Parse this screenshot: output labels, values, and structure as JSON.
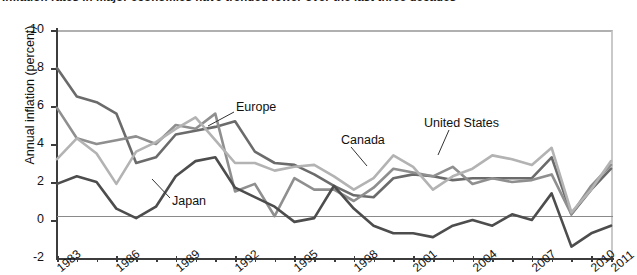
{
  "title": "Inflation rates in major economies have trended lower over the last three decades",
  "axes": {
    "ylabel": "Annual inflation (percent)",
    "yticks": [
      "10",
      "8",
      "6",
      "4",
      "2",
      "0",
      "-2"
    ],
    "xticks": [
      "1983",
      "1986",
      "1989",
      "1992",
      "1995",
      "1998",
      "2001",
      "2004",
      "2007",
      "2010",
      "2011"
    ]
  },
  "series_labels": {
    "europe": "Europe",
    "japan": "Japan",
    "canada": "Canada",
    "united_states": "United States"
  },
  "colors": {
    "europe": "#6b6b6b",
    "japan": "#4d4d4d",
    "canada": "#8f8f8f",
    "united_states": "#b3b3b3",
    "axis": "#3c3c3c",
    "text": "#111111"
  },
  "chart_data": {
    "type": "line",
    "title": "Inflation rates in major economies have trended lower over the last three decades",
    "xlabel": "",
    "ylabel": "Annual inflation (percent)",
    "ylim": [
      -2,
      10
    ],
    "xlim": [
      1983,
      2011
    ],
    "grid": false,
    "legend": "inline-labels",
    "x": [
      1983,
      1984,
      1985,
      1986,
      1987,
      1988,
      1989,
      1990,
      1991,
      1992,
      1993,
      1994,
      1995,
      1996,
      1997,
      1998,
      1999,
      2000,
      2001,
      2002,
      2003,
      2004,
      2005,
      2006,
      2007,
      2008,
      2009,
      2010,
      2011
    ],
    "series": [
      {
        "name": "Europe",
        "color": "#6b6b6b",
        "values": [
          8.0,
          6.5,
          6.2,
          5.6,
          3.0,
          3.3,
          4.5,
          4.7,
          4.9,
          5.2,
          3.6,
          3.0,
          2.9,
          2.4,
          1.8,
          1.3,
          1.2,
          2.2,
          2.4,
          2.3,
          2.1,
          2.2,
          2.2,
          2.2,
          2.2,
          3.3,
          0.3,
          1.6,
          2.7
        ]
      },
      {
        "name": "Canada",
        "color": "#8f8f8f",
        "values": [
          5.9,
          4.3,
          4.0,
          4.2,
          4.4,
          4.0,
          5.0,
          4.8,
          5.6,
          1.5,
          1.9,
          0.2,
          2.2,
          1.6,
          1.6,
          1.0,
          1.7,
          2.7,
          2.5,
          2.3,
          2.8,
          1.9,
          2.2,
          2.0,
          2.1,
          2.4,
          0.3,
          1.8,
          2.9
        ]
      },
      {
        "name": "United States",
        "color": "#b3b3b3",
        "values": [
          3.2,
          4.3,
          3.5,
          1.9,
          3.6,
          4.1,
          4.8,
          5.4,
          4.2,
          3.0,
          3.0,
          2.6,
          2.8,
          2.9,
          2.3,
          1.6,
          2.2,
          3.4,
          2.8,
          1.6,
          2.3,
          2.7,
          3.4,
          3.2,
          2.9,
          3.8,
          0.4,
          1.6,
          3.1
        ]
      },
      {
        "name": "Japan",
        "color": "#4d4d4d",
        "values": [
          1.9,
          2.3,
          2.0,
          0.6,
          0.1,
          0.7,
          2.3,
          3.1,
          3.3,
          1.7,
          1.2,
          0.7,
          -0.1,
          0.1,
          1.8,
          0.6,
          -0.3,
          -0.7,
          -0.7,
          -0.9,
          -0.3,
          0.0,
          -0.3,
          0.3,
          0.0,
          1.4,
          -1.4,
          -0.7,
          -0.3
        ]
      }
    ],
    "annotations": [
      {
        "text": "Europe",
        "x": 1992,
        "y": 6.4
      },
      {
        "text": "Japan",
        "x": 1988.5,
        "y": 1.2
      },
      {
        "text": "Canada",
        "x": 1999,
        "y": 4.1
      },
      {
        "text": "United States",
        "x": 2004,
        "y": 4.6
      }
    ]
  }
}
